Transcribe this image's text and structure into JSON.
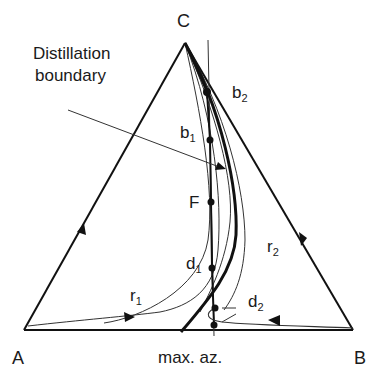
{
  "diagram": {
    "type": "ternary-residue-curve-map",
    "vertices": {
      "top": "C",
      "left": "A",
      "right": "B"
    },
    "axis_label": "max. az.",
    "annotation": {
      "line1": "Distillation",
      "line2": "boundary"
    },
    "points": {
      "F": {
        "label": "F"
      },
      "b1": {
        "base": "b",
        "sub": "1"
      },
      "b2": {
        "base": "b",
        "sub": "2"
      },
      "d1": {
        "base": "d",
        "sub": "1"
      },
      "d2": {
        "base": "d",
        "sub": "2"
      }
    },
    "curves": {
      "r1": {
        "base": "r",
        "sub": "1"
      },
      "r2": {
        "base": "r",
        "sub": "2"
      }
    },
    "colors": {
      "line": "#111111",
      "thin": "#333333",
      "background": "#ffffff"
    }
  }
}
